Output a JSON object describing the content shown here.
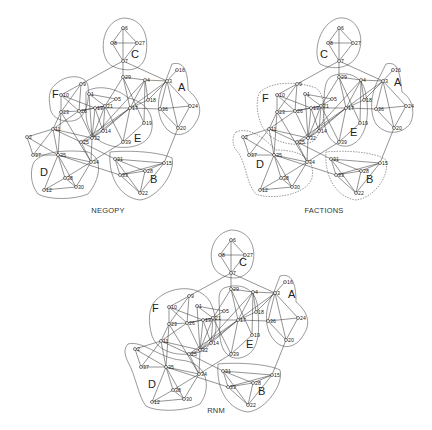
{
  "figure": {
    "panels": [
      {
        "id": "negopy",
        "title": "NEGOPY",
        "offset": [
          0,
          0
        ],
        "title_pos": [
          108,
          213
        ]
      },
      {
        "id": "factions",
        "title": "FACTIONS",
        "offset": [
          216,
          0
        ],
        "title_pos": [
          324,
          213
        ]
      },
      {
        "id": "rnm",
        "title": "RNM",
        "offset": [
          108,
          212
        ],
        "title_pos": [
          216,
          413
        ]
      }
    ],
    "groups": [
      "A",
      "B",
      "C",
      "D",
      "E",
      "F"
    ],
    "nodes": {
      "6": [
        123,
        28
      ],
      "8": [
        112,
        43
      ],
      "27": [
        137,
        43
      ],
      "7": [
        123,
        61
      ],
      "29": [
        123,
        77
      ],
      "4": [
        145,
        80
      ],
      "3": [
        167,
        81
      ],
      "16": [
        177,
        70
      ],
      "9": [
        81,
        84
      ],
      "10": [
        61,
        95
      ],
      "1": [
        89,
        94
      ],
      "5": [
        116,
        99
      ],
      "21": [
        105,
        106
      ],
      "18": [
        148,
        100
      ],
      "17": [
        130,
        108
      ],
      "13": [
        95,
        108
      ],
      "23": [
        61,
        112
      ],
      "26": [
        79,
        111
      ],
      "36": [
        160,
        109
      ],
      "24": [
        190,
        106
      ],
      "19": [
        144,
        123
      ],
      "20": [
        178,
        128
      ],
      "11": [
        53,
        129
      ],
      "14": [
        103,
        131
      ],
      "25": [
        81,
        142
      ],
      "32": [
        92,
        138
      ],
      "39": [
        123,
        142
      ],
      "2": [
        27,
        137
      ],
      "37": [
        33,
        155
      ],
      "35": [
        58,
        155
      ],
      "34": [
        91,
        162
      ],
      "31": [
        115,
        159
      ],
      "15": [
        164,
        163
      ],
      "28": [
        145,
        171
      ],
      "33": [
        120,
        175
      ],
      "38": [
        65,
        178
      ],
      "30": [
        76,
        187
      ],
      "12": [
        44,
        190
      ],
      "22": [
        140,
        193
      ]
    },
    "edges": [
      [
        "6",
        "8"
      ],
      [
        "6",
        "27"
      ],
      [
        "6",
        "7"
      ],
      [
        "8",
        "27"
      ],
      [
        "8",
        "7"
      ],
      [
        "27",
        "7"
      ],
      [
        "7",
        "29"
      ],
      [
        "7",
        "9"
      ],
      [
        "7",
        "3"
      ],
      [
        "29",
        "4"
      ],
      [
        "29",
        "21"
      ],
      [
        "29",
        "17"
      ],
      [
        "29",
        "19"
      ],
      [
        "4",
        "3"
      ],
      [
        "4",
        "18"
      ],
      [
        "4",
        "17"
      ],
      [
        "4",
        "19"
      ],
      [
        "4",
        "32"
      ],
      [
        "3",
        "16"
      ],
      [
        "3",
        "36"
      ],
      [
        "3",
        "24"
      ],
      [
        "3",
        "20"
      ],
      [
        "3",
        "18"
      ],
      [
        "3",
        "17"
      ],
      [
        "36",
        "24"
      ],
      [
        "36",
        "20"
      ],
      [
        "24",
        "20"
      ],
      [
        "36",
        "17"
      ],
      [
        "20",
        "15"
      ],
      [
        "9",
        "10"
      ],
      [
        "9",
        "26"
      ],
      [
        "9",
        "23"
      ],
      [
        "10",
        "26"
      ],
      [
        "10",
        "23"
      ],
      [
        "10",
        "13"
      ],
      [
        "1",
        "21"
      ],
      [
        "1",
        "5"
      ],
      [
        "1",
        "32"
      ],
      [
        "21",
        "5"
      ],
      [
        "21",
        "13"
      ],
      [
        "21",
        "14"
      ],
      [
        "21",
        "32"
      ],
      [
        "21",
        "39"
      ],
      [
        "21",
        "26"
      ],
      [
        "13",
        "32"
      ],
      [
        "13",
        "26"
      ],
      [
        "13",
        "17"
      ],
      [
        "13",
        "14"
      ],
      [
        "17",
        "32"
      ],
      [
        "17",
        "39"
      ],
      [
        "17",
        "14"
      ],
      [
        "17",
        "18"
      ],
      [
        "17",
        "25"
      ],
      [
        "23",
        "26"
      ],
      [
        "23",
        "11"
      ],
      [
        "23",
        "35"
      ],
      [
        "23",
        "34"
      ],
      [
        "26",
        "11"
      ],
      [
        "26",
        "32"
      ],
      [
        "11",
        "2"
      ],
      [
        "11",
        "37"
      ],
      [
        "11",
        "32"
      ],
      [
        "11",
        "25"
      ],
      [
        "11",
        "35"
      ],
      [
        "2",
        "37"
      ],
      [
        "2",
        "35"
      ],
      [
        "37",
        "35"
      ],
      [
        "25",
        "32"
      ],
      [
        "25",
        "34"
      ],
      [
        "25",
        "31"
      ],
      [
        "32",
        "14"
      ],
      [
        "32",
        "34"
      ],
      [
        "35",
        "34"
      ],
      [
        "35",
        "38"
      ],
      [
        "35",
        "30"
      ],
      [
        "35",
        "12"
      ],
      [
        "35",
        "33"
      ],
      [
        "34",
        "38"
      ],
      [
        "34",
        "30"
      ],
      [
        "34",
        "39"
      ],
      [
        "38",
        "30"
      ],
      [
        "38",
        "12"
      ],
      [
        "12",
        "30"
      ],
      [
        "31",
        "33"
      ],
      [
        "31",
        "28"
      ],
      [
        "31",
        "22"
      ],
      [
        "31",
        "15"
      ],
      [
        "15",
        "28"
      ],
      [
        "15",
        "33"
      ],
      [
        "15",
        "22"
      ],
      [
        "28",
        "33"
      ],
      [
        "28",
        "22"
      ],
      [
        "33",
        "22"
      ],
      [
        "39",
        "19"
      ]
    ],
    "hulls": {
      "negopy": [
        {
          "label": "C",
          "lpos": [
            131,
            58
          ],
          "path": "M123,18 C145,18 150,40 145,58 C140,72 125,72 112,66 C98,58 100,22 123,18 Z"
        },
        {
          "label": "A",
          "lpos": [
            178,
            91
          ],
          "path": "M172,64 C186,60 188,76 188,90 C198,98 204,110 196,122 C190,134 176,140 166,128 C154,114 158,92 166,80 Z"
        },
        {
          "label": "F",
          "lpos": [
            52,
            98
          ],
          "path": "M56,84 C66,74 86,74 88,86 C90,100 86,116 76,120 C64,124 50,118 50,106 C48,96 50,88 56,84 Z"
        },
        {
          "label": "E",
          "lpos": [
            134,
            142
          ],
          "path": "M86,92 C96,84 118,88 128,98 C140,100 154,110 152,128 C150,146 128,150 112,146 C96,142 86,132 86,112 Z",
          "dashed": false
        },
        {
          "label": "D",
          "lpos": [
            40,
            176
          ],
          "path": "M34,162 C44,150 70,150 88,152 C104,158 100,180 88,194 C74,200 48,200 38,194 C30,184 30,170 34,162 Z"
        },
        {
          "label": "B",
          "lpos": [
            150,
            183
          ],
          "path": "M110,152 C130,150 160,152 172,158 C176,172 158,198 140,200 C122,198 108,180 110,152 Z"
        }
      ],
      "factions": [
        {
          "label": "C",
          "lpos": [
            104,
            58
          ],
          "path": "M123,18 C140,16 150,36 142,54 C134,70 116,70 104,64 C96,52 104,22 123,18 Z"
        },
        {
          "label": "A",
          "lpos": [
            178,
            86
          ],
          "path": "M170,64 C184,60 184,78 186,92 C196,98 200,112 194,124 C186,134 170,136 160,124 C152,110 156,90 164,76 Z"
        },
        {
          "label": "F",
          "lpos": [
            46,
            102
          ],
          "path": "M44,92 C58,80 84,82 100,88 C112,96 110,132 96,142 C76,148 54,142 46,126 C40,114 40,98 44,92 Z",
          "dashed": true
        },
        {
          "label": "E",
          "lpos": [
            134,
            136
          ],
          "path": "M116,76 C132,70 148,76 150,96 C154,116 150,142 132,146 C116,148 106,132 108,110 C108,92 108,80 116,76 Z"
        },
        {
          "label": "D",
          "lpos": [
            40,
            168
          ],
          "path": "M20,132 C34,126 50,140 60,150 C80,150 100,156 96,178 C90,196 54,200 40,194 C30,184 30,160 20,150 C16,144 16,136 20,132 Z",
          "dashed": true
        },
        {
          "label": "B",
          "lpos": [
            150,
            183
          ],
          "path": "M110,152 C130,150 160,152 170,160 C174,176 158,198 140,200 C122,198 108,178 110,152 Z",
          "dashed": true
        }
      ],
      "rnm": [
        {
          "label": "C",
          "lpos": [
            131,
            54
          ],
          "path": "M123,18 C144,18 150,40 143,56 C136,68 122,68 112,62 C98,54 100,22 123,18 Z"
        },
        {
          "label": "A",
          "lpos": [
            180,
            86
          ],
          "path": "M172,64 C186,60 188,76 188,90 C198,98 204,110 196,122 C190,134 176,140 166,128 C154,114 158,92 166,80 Z"
        },
        {
          "label": "F",
          "lpos": [
            44,
            100
          ],
          "path": "M48,88 C64,72 96,72 104,94 C112,116 108,132 92,140 C70,146 50,140 44,124 C40,110 40,96 48,88 Z"
        },
        {
          "label": "E",
          "lpos": [
            138,
            136
          ],
          "path": "M116,76 C132,70 150,76 150,100 C152,124 150,142 132,146 C116,148 110,132 112,110 C112,92 108,80 116,76 Z"
        },
        {
          "label": "D",
          "lpos": [
            40,
            176
          ],
          "path": "M20,132 C34,128 52,146 72,148 C100,150 104,176 92,192 C76,200 48,200 38,194 C30,184 28,164 20,150 C16,142 16,136 20,132 Z"
        },
        {
          "label": "B",
          "lpos": [
            150,
            183
          ],
          "path": "M110,152 C130,150 160,152 172,158 C176,172 158,198 140,200 C122,198 108,180 110,152 Z"
        }
      ]
    }
  }
}
